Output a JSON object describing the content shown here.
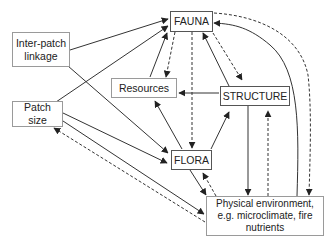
{
  "diagram": {
    "type": "ecological-interaction-diagram",
    "nodes": [
      {
        "id": "fauna",
        "label": "FAUNA"
      },
      {
        "id": "inter_patch",
        "label": "Inter-patch\nlinkage"
      },
      {
        "id": "patch_size",
        "label": "Patch\nsize"
      },
      {
        "id": "resources",
        "label": "Resources"
      },
      {
        "id": "structure",
        "label": "STRUCTURE"
      },
      {
        "id": "flora",
        "label": "FLORA"
      },
      {
        "id": "physical_env",
        "label": "Physical environment,\ne.g. microclimate, fire\nnutrients"
      }
    ],
    "edges": [
      {
        "from": "inter_patch",
        "to": "fauna",
        "style": "solid"
      },
      {
        "from": "patch_size",
        "to": "fauna",
        "style": "solid"
      },
      {
        "from": "inter_patch",
        "to": "flora",
        "style": "solid"
      },
      {
        "from": "patch_size",
        "to": "flora",
        "style": "solid"
      },
      {
        "from": "patch_size",
        "to": "physical_env",
        "style": "solid"
      },
      {
        "from": "physical_env",
        "to": "patch_size",
        "style": "dashed"
      },
      {
        "from": "resources",
        "to": "fauna",
        "style": "solid"
      },
      {
        "from": "fauna",
        "to": "resources",
        "style": "dashed"
      },
      {
        "from": "fauna",
        "to": "flora",
        "style": "dashed"
      },
      {
        "from": "structure",
        "to": "fauna",
        "style": "solid"
      },
      {
        "from": "fauna",
        "to": "structure",
        "style": "dashed"
      },
      {
        "from": "structure",
        "to": "resources",
        "style": "solid"
      },
      {
        "from": "flora",
        "to": "resources",
        "style": "solid"
      },
      {
        "from": "flora",
        "to": "structure",
        "style": "solid"
      },
      {
        "from": "structure",
        "to": "physical_env",
        "style": "solid"
      },
      {
        "from": "physical_env",
        "to": "structure",
        "style": "dashed"
      },
      {
        "from": "flora",
        "to": "physical_env",
        "style": "solid"
      },
      {
        "from": "physical_env",
        "to": "flora",
        "style": "dashed"
      },
      {
        "from": "physical_env",
        "to": "fauna",
        "style": "solid"
      },
      {
        "from": "fauna",
        "to": "physical_env",
        "style": "dashed"
      }
    ],
    "colors": {
      "line": "#333333",
      "box_border": "#9a9a9a",
      "text": "#222222"
    }
  }
}
